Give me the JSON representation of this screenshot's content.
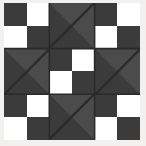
{
  "artwork": {
    "title": "Quilt Block Pattern",
    "kind": "patchwork-quilt-block",
    "canvas": {
      "width": 146,
      "height": 146
    },
    "colors": {
      "background": "#ffffff",
      "margin": "#f2f1ef",
      "dark_patch": "#3b3b3b",
      "mid_patch": "#4b4b4b",
      "light_patch": "#ffffff",
      "seam_line": "#2a2a2a"
    },
    "grid": {
      "rows": 3,
      "cols": 3
    },
    "blocks": [
      {
        "position": "top-left",
        "type": "four-patch",
        "squares": [
          "dark",
          "light",
          "light",
          "dark"
        ]
      },
      {
        "position": "top-center",
        "type": "half-square-triangle",
        "light_half": "upper-right"
      },
      {
        "position": "top-right",
        "type": "four-patch",
        "squares": [
          "dark",
          "light",
          "light",
          "dark"
        ]
      },
      {
        "position": "middle-left",
        "type": "half-square-triangle",
        "light_half": "upper-right"
      },
      {
        "position": "center",
        "type": "four-patch",
        "squares": [
          "dark",
          "light",
          "light",
          "dark"
        ]
      },
      {
        "position": "middle-right",
        "type": "half-square-triangle",
        "light_half": "upper-right"
      },
      {
        "position": "bottom-left",
        "type": "four-patch",
        "squares": [
          "dark",
          "light",
          "light",
          "dark"
        ]
      },
      {
        "position": "bottom-center",
        "type": "half-square-triangle",
        "light_half": "upper-right"
      },
      {
        "position": "bottom-right",
        "type": "four-patch",
        "squares": [
          "dark",
          "light",
          "light",
          "dark"
        ]
      }
    ],
    "labels": {
      "top_left": "Top Left Four-Patch",
      "top_center": "Top Center Triangle",
      "top_right": "Top Right Four-Patch",
      "middle_left": "Middle Left Triangle",
      "center": "Center Four-Patch",
      "middle_right": "Middle Right Triangle",
      "bottom_left": "Bottom Left Four-Patch",
      "bottom_center": "Bottom Center Triangle",
      "bottom_right": "Bottom Right Four-Patch"
    }
  }
}
